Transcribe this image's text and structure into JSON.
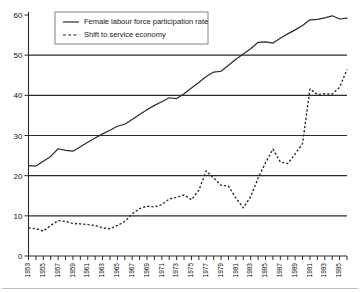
{
  "chart_data": {
    "type": "line",
    "title": "",
    "xlabel": "",
    "ylabel": "",
    "ylim": [
      0,
      60
    ],
    "xlim": [
      1953,
      1996
    ],
    "grid": true,
    "gridlines_y": [
      10,
      20,
      30,
      40,
      50
    ],
    "legend_position": "top-left",
    "y_ticks": [
      0,
      10,
      20,
      30,
      40,
      50,
      60
    ],
    "x_ticks_all": [
      1953,
      1954,
      1955,
      1956,
      1957,
      1958,
      1959,
      1960,
      1961,
      1962,
      1963,
      1964,
      1965,
      1966,
      1967,
      1968,
      1969,
      1970,
      1971,
      1972,
      1973,
      1974,
      1975,
      1976,
      1977,
      1978,
      1979,
      1980,
      1981,
      1982,
      1983,
      1984,
      1985,
      1986,
      1987,
      1988,
      1989,
      1990,
      1991,
      1992,
      1993,
      1994,
      1995,
      1996
    ],
    "x_tick_labels": [
      "1953",
      "1955",
      "1957",
      "1959",
      "1961",
      "1963",
      "1965",
      "1967",
      "1969",
      "1971",
      "1973",
      "1975",
      "1977",
      "1979",
      "1981",
      "1983",
      "1985",
      "1987",
      "1989",
      "1991",
      "1993",
      "1995"
    ],
    "x": [
      1953,
      1954,
      1955,
      1956,
      1957,
      1958,
      1959,
      1960,
      1961,
      1962,
      1963,
      1964,
      1965,
      1966,
      1967,
      1968,
      1969,
      1970,
      1971,
      1972,
      1973,
      1974,
      1975,
      1976,
      1977,
      1978,
      1979,
      1980,
      1981,
      1982,
      1983,
      1984,
      1985,
      1986,
      1987,
      1988,
      1989,
      1990,
      1991,
      1992,
      1993,
      1994,
      1995,
      1996
    ],
    "series": [
      {
        "name": "Female labour force participation rate",
        "style": "solid",
        "color": "#2b2b2b",
        "values": [
          22.5,
          22.4,
          23.6,
          24.8,
          26.7,
          26.3,
          26.1,
          27.2,
          28.3,
          29.4,
          30.4,
          31.3,
          32.3,
          32.8,
          34.0,
          35.2,
          36.4,
          37.5,
          38.4,
          39.4,
          39.2,
          40.4,
          41.8,
          43.2,
          44.7,
          45.8,
          46.0,
          47.5,
          49.0,
          50.3,
          51.6,
          53.2,
          53.3,
          53.0,
          54.2,
          55.3,
          56.3,
          57.4,
          58.8,
          58.9,
          59.3,
          59.8,
          59.0,
          59.2
        ]
      },
      {
        "name": "Shift to service economy",
        "style": "dashed",
        "color": "#2b2b2b",
        "values": [
          7.0,
          6.8,
          6.2,
          7.6,
          8.8,
          8.6,
          8.1,
          8.0,
          7.8,
          7.6,
          7.0,
          6.8,
          7.6,
          8.6,
          10.5,
          11.8,
          12.4,
          12.2,
          12.8,
          14.2,
          14.6,
          15.2,
          14.0,
          16.4,
          21.2,
          19.4,
          17.6,
          17.4,
          14.4,
          12.0,
          14.8,
          19.4,
          23.2,
          26.6,
          23.4,
          23.0,
          25.4,
          28.0,
          31.2,
          29.8,
          30.2,
          30.2,
          34.0,
          38.2
        ]
      }
    ],
    "series_dashed_tail": {
      "name": "Shift to service economy tail",
      "x": [
        1990,
        1991,
        1992,
        1993,
        1994,
        1995,
        1996
      ],
      "values": [
        38.2,
        41.6,
        40.2,
        40.4,
        40.3,
        42.0,
        46.4
      ]
    }
  },
  "legend": {
    "entries": [
      {
        "label": "Female labour force participation rate",
        "style": "solid"
      },
      {
        "label": "Shift to service economy",
        "style": "dashed"
      }
    ]
  }
}
